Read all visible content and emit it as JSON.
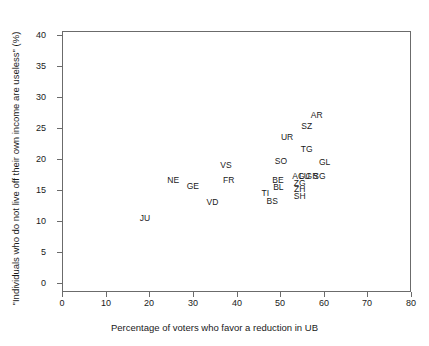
{
  "chart_data": {
    "type": "scatter",
    "title": "",
    "xlabel": "Percentage of voters who favor a reduction in UB",
    "ylabel": "\"Individuals who do not live off their own income are useless\" (%)",
    "xlim": [
      0,
      80
    ],
    "ylim": [
      0,
      41
    ],
    "xticks": [
      0,
      10,
      20,
      30,
      40,
      50,
      60,
      70,
      80
    ],
    "yticks": [
      0,
      5,
      10,
      15,
      20,
      25,
      30,
      35,
      40
    ],
    "xtick_labels": [
      "0",
      "10",
      "20",
      "30",
      "40",
      "50",
      "60",
      "70",
      "80"
    ],
    "ytick_labels": [
      "0",
      "5",
      "10",
      "15",
      "20",
      "25",
      "30",
      "35",
      "40"
    ],
    "grid": false,
    "legend": false,
    "marker": "text-label",
    "points": [
      {
        "label": "JU",
        "x": 19.0,
        "y": 10.5
      },
      {
        "label": "NE",
        "x": 25.5,
        "y": 16.6
      },
      {
        "label": "GE",
        "x": 30.0,
        "y": 15.6
      },
      {
        "label": "VD",
        "x": 34.5,
        "y": 13.0
      },
      {
        "label": "VS",
        "x": 37.6,
        "y": 19.1
      },
      {
        "label": "FR",
        "x": 38.2,
        "y": 16.6
      },
      {
        "label": "TI",
        "x": 46.6,
        "y": 14.5
      },
      {
        "label": "BS",
        "x": 48.2,
        "y": 13.2
      },
      {
        "label": "BE",
        "x": 49.5,
        "y": 16.6
      },
      {
        "label": "BL",
        "x": 49.6,
        "y": 15.5
      },
      {
        "label": "SO",
        "x": 50.2,
        "y": 19.6
      },
      {
        "label": "UR",
        "x": 51.6,
        "y": 23.5
      },
      {
        "label": "AG",
        "x": 54.2,
        "y": 17.3
      },
      {
        "label": "LU",
        "x": 55.6,
        "y": 17.3
      },
      {
        "label": "GR",
        "x": 57.3,
        "y": 17.3
      },
      {
        "label": "SG",
        "x": 59.0,
        "y": 17.3
      },
      {
        "label": "ZG",
        "x": 54.5,
        "y": 16.2
      },
      {
        "label": "ZH",
        "x": 54.5,
        "y": 15.2
      },
      {
        "label": "SH",
        "x": 54.5,
        "y": 14.1
      },
      {
        "label": "SZ",
        "x": 56.1,
        "y": 25.4
      },
      {
        "label": "TG",
        "x": 56.1,
        "y": 21.6
      },
      {
        "label": "AR",
        "x": 58.4,
        "y": 27.1
      },
      {
        "label": "GL",
        "x": 60.2,
        "y": 19.5
      }
    ]
  },
  "axes": {
    "x_title": "Percentage of voters who favor a reduction in UB",
    "y_title": "\"Individuals who do not live off their own income are useless\" (%)"
  },
  "colors": {
    "frame": "#6b6b6b",
    "text": "#1a1a1a",
    "background": "#ffffff"
  }
}
